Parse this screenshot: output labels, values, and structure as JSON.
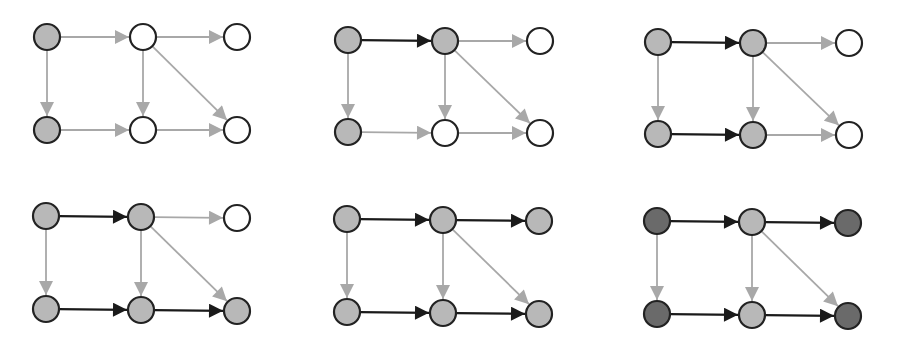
{
  "colors": {
    "background": "#ffffff",
    "node_stroke": "#222222",
    "node_white": "#ffffff",
    "node_light": "#b8b8b8",
    "node_dark": "#6a6a6a",
    "edge_light": "#a8a8a8",
    "edge_dark": "#1a1a1a"
  },
  "graph": {
    "nodes": [
      "A",
      "B",
      "C",
      "D",
      "E",
      "F"
    ],
    "layout_note": "A,B,C top row left-to-right; D,E,F bottom row left-to-right",
    "edges": [
      {
        "id": "AB",
        "from": "A",
        "to": "B"
      },
      {
        "id": "BC",
        "from": "B",
        "to": "C"
      },
      {
        "id": "AD",
        "from": "A",
        "to": "D"
      },
      {
        "id": "BE",
        "from": "B",
        "to": "E"
      },
      {
        "id": "BF",
        "from": "B",
        "to": "F"
      },
      {
        "id": "DE",
        "from": "D",
        "to": "E"
      },
      {
        "id": "EF",
        "from": "E",
        "to": "F"
      }
    ]
  },
  "panels": [
    {
      "index": 1,
      "positions": {
        "A": [
          47,
          37
        ],
        "B": [
          143,
          37
        ],
        "C": [
          237,
          37
        ],
        "D": [
          47,
          130
        ],
        "E": [
          143,
          130
        ],
        "F": [
          237,
          130
        ]
      },
      "node_fill": {
        "A": "light",
        "B": "white",
        "C": "white",
        "D": "light",
        "E": "white",
        "F": "white"
      },
      "dark_edges": []
    },
    {
      "index": 2,
      "positions": {
        "A": [
          348,
          40
        ],
        "B": [
          445,
          41
        ],
        "C": [
          540,
          41
        ],
        "D": [
          348,
          132
        ],
        "E": [
          445,
          133
        ],
        "F": [
          540,
          133
        ]
      },
      "node_fill": {
        "A": "light",
        "B": "light",
        "C": "white",
        "D": "light",
        "E": "white",
        "F": "white"
      },
      "dark_edges": [
        "AB"
      ]
    },
    {
      "index": 3,
      "positions": {
        "A": [
          658,
          42
        ],
        "B": [
          753,
          43
        ],
        "C": [
          849,
          43
        ],
        "D": [
          658,
          134
        ],
        "E": [
          753,
          135
        ],
        "F": [
          849,
          135
        ]
      },
      "node_fill": {
        "A": "light",
        "B": "light",
        "C": "white",
        "D": "light",
        "E": "light",
        "F": "white"
      },
      "dark_edges": [
        "AB",
        "DE"
      ]
    },
    {
      "index": 4,
      "positions": {
        "A": [
          46,
          216
        ],
        "B": [
          141,
          217
        ],
        "C": [
          237,
          218
        ],
        "D": [
          46,
          309
        ],
        "E": [
          141,
          310
        ],
        "F": [
          237,
          311
        ]
      },
      "node_fill": {
        "A": "light",
        "B": "light",
        "C": "white",
        "D": "light",
        "E": "light",
        "F": "light"
      },
      "dark_edges": [
        "AB",
        "DE",
        "EF"
      ]
    },
    {
      "index": 5,
      "positions": {
        "A": [
          347,
          219
        ],
        "B": [
          443,
          220
        ],
        "C": [
          539,
          221
        ],
        "D": [
          347,
          312
        ],
        "E": [
          443,
          313
        ],
        "F": [
          539,
          314
        ]
      },
      "node_fill": {
        "A": "light",
        "B": "light",
        "C": "light",
        "D": "light",
        "E": "light",
        "F": "light"
      },
      "dark_edges": [
        "AB",
        "BC",
        "DE",
        "EF"
      ]
    },
    {
      "index": 6,
      "positions": {
        "A": [
          657,
          221
        ],
        "B": [
          752,
          222
        ],
        "C": [
          848,
          223
        ],
        "D": [
          657,
          314
        ],
        "E": [
          752,
          315
        ],
        "F": [
          848,
          316
        ]
      },
      "node_fill": {
        "A": "dark",
        "B": "light",
        "C": "dark",
        "D": "dark",
        "E": "light",
        "F": "dark"
      },
      "dark_edges": [
        "AB",
        "BC",
        "DE",
        "EF"
      ]
    }
  ],
  "node_radius": 13
}
